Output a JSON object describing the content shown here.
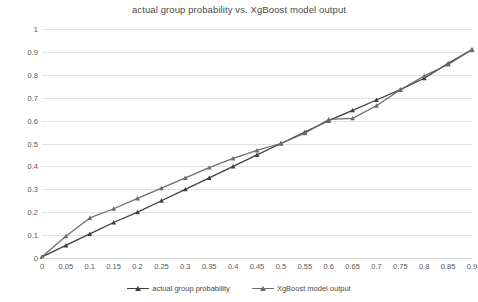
{
  "chart_data": {
    "type": "line",
    "title": "actual group probability vs. XgBoost model output",
    "xlabel": "",
    "ylabel": "",
    "xlim": [
      0,
      0.9
    ],
    "ylim": [
      0,
      1
    ],
    "grid": true,
    "legend_position": "bottom",
    "x_ticks": [
      "0",
      "0.05",
      "0.1",
      "0.15",
      "0.2",
      "0.25",
      "0.3",
      "0.35",
      "0.4",
      "0.45",
      "0.5",
      "0.55",
      "0.6",
      "0.65",
      "0.7",
      "0.75",
      "0.8",
      "0.85",
      "0.9"
    ],
    "y_ticks": [
      "0",
      "0.1",
      "0.2",
      "0.3",
      "0.4",
      "0.5",
      "0.6",
      "0.7",
      "0.8",
      "0.9",
      "1"
    ],
    "x": [
      0,
      0.05,
      0.1,
      0.15,
      0.2,
      0.25,
      0.3,
      0.35,
      0.4,
      0.45,
      0.5,
      0.55,
      0.6,
      0.65,
      0.7,
      0.75,
      0.8,
      0.85,
      0.9
    ],
    "series": [
      {
        "name": "actual group probability",
        "color": "#3f3f3f",
        "marker": "triangle",
        "values": [
          0.005,
          0.055,
          0.105,
          0.155,
          0.2,
          0.25,
          0.3,
          0.35,
          0.4,
          0.45,
          0.5,
          0.55,
          0.6,
          0.645,
          0.69,
          0.735,
          0.785,
          0.85,
          0.91
        ]
      },
      {
        "name": "XgBoost model output",
        "color": "#6d6d6d",
        "marker": "triangle",
        "values": [
          0.005,
          0.095,
          0.175,
          0.215,
          0.26,
          0.305,
          0.35,
          0.395,
          0.435,
          0.47,
          0.5,
          0.545,
          0.605,
          0.61,
          0.665,
          0.735,
          0.795,
          0.845,
          0.91
        ]
      }
    ]
  },
  "legend": {
    "items": [
      {
        "label": "actual group probability"
      },
      {
        "label": "XgBoost model output"
      }
    ]
  }
}
